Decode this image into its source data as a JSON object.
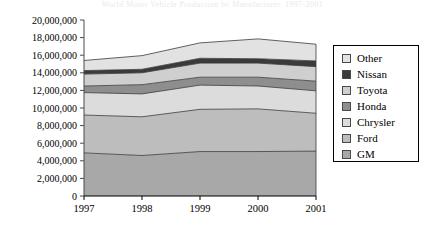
{
  "title_strip": "World Motor Vehicle Production by Manufacturer, 1997-2001",
  "legend": {
    "position": "right",
    "items": [
      {
        "label": "Other",
        "color": "#e2e2e2",
        "swatch_name": "legend-swatch-other"
      },
      {
        "label": "Nissan",
        "color": "#3b3b3b",
        "swatch_name": "legend-swatch-nissan"
      },
      {
        "label": "Toyota",
        "color": "#cfcfcf",
        "swatch_name": "legend-swatch-toyota"
      },
      {
        "label": "Honda",
        "color": "#8e8e8e",
        "swatch_name": "legend-swatch-honda"
      },
      {
        "label": "Chrysler",
        "color": "#dcdcdc",
        "swatch_name": "legend-swatch-chrysler"
      },
      {
        "label": "Ford",
        "color": "#bdbdbd",
        "swatch_name": "legend-swatch-ford"
      },
      {
        "label": "GM",
        "color": "#a8a8a8",
        "swatch_name": "legend-swatch-gm"
      }
    ]
  },
  "axis": {
    "y_ticks": [
      "20,000,000",
      "18,000,000",
      "16,000,000",
      "14,000,000",
      "12,000,000",
      "10,000,000",
      "8,000,000",
      "6,000,000",
      "4,000,000",
      "2,000,000",
      "0"
    ],
    "x_ticks": [
      "1997",
      "1998",
      "1999",
      "2000",
      "2001"
    ],
    "ylim": [
      0,
      20000000
    ],
    "ystep": 2000000
  },
  "chart_data": {
    "type": "area",
    "stacked": true,
    "title": "World Motor Vehicle Production by Manufacturer, 1997-2001",
    "xlabel": "",
    "ylabel": "",
    "ylim": [
      0,
      20000000
    ],
    "ytick_step": 2000000,
    "grid": false,
    "legend_position": "right",
    "x": [
      "1997",
      "1998",
      "1999",
      "2000",
      "2001"
    ],
    "categories": [
      "1997",
      "1998",
      "1999",
      "2000",
      "2001"
    ],
    "stack_order_bottom_to_top": [
      "GM",
      "Ford",
      "Chrysler",
      "Honda",
      "Toyota",
      "Nissan",
      "Other"
    ],
    "series": [
      {
        "name": "GM",
        "color": "#a8a8a8",
        "values": [
          4900000,
          4600000,
          5050000,
          5050000,
          5100000
        ]
      },
      {
        "name": "Ford",
        "color": "#bdbdbd",
        "values": [
          4300000,
          4400000,
          4800000,
          4850000,
          4300000
        ]
      },
      {
        "name": "Chrysler",
        "color": "#dcdcdc",
        "values": [
          2550000,
          2600000,
          2750000,
          2600000,
          2550000
        ]
      },
      {
        "name": "Honda",
        "color": "#8e8e8e",
        "values": [
          750000,
          1050000,
          900000,
          1000000,
          1100000
        ]
      },
      {
        "name": "Toyota",
        "color": "#cfcfcf",
        "values": [
          1350000,
          1350000,
          1600000,
          1600000,
          1650000
        ]
      },
      {
        "name": "Nissan",
        "color": "#3b3b3b",
        "values": [
          400000,
          400000,
          550000,
          500000,
          650000
        ]
      },
      {
        "name": "Other",
        "color": "#e2e2e2",
        "values": [
          1150000,
          1550000,
          1750000,
          2250000,
          1900000
        ]
      }
    ],
    "cumulative_tops": {
      "GM": [
        4900000,
        4600000,
        5050000,
        5050000,
        5100000
      ],
      "Ford": [
        9200000,
        9000000,
        9850000,
        9900000,
        9400000
      ],
      "Chrysler": [
        11750000,
        11600000,
        12600000,
        12500000,
        11950000
      ],
      "Honda": [
        12500000,
        12650000,
        13500000,
        13500000,
        13050000
      ],
      "Toyota": [
        13850000,
        14000000,
        15100000,
        15100000,
        14700000
      ],
      "Nissan": [
        14250000,
        14400000,
        15650000,
        15600000,
        15350000
      ],
      "Other": [
        15400000,
        15950000,
        17400000,
        17850000,
        17250000
      ]
    },
    "totals": [
      15400000,
      15950000,
      17400000,
      17850000,
      17250000
    ]
  }
}
